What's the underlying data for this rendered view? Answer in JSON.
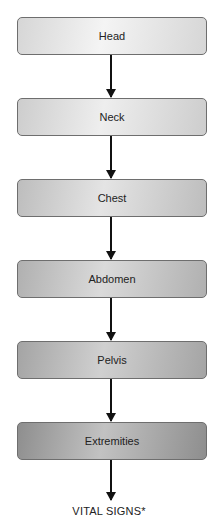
{
  "diagram": {
    "type": "vertical-flowchart",
    "nodes": [
      {
        "label": "Head",
        "gradient": [
          "#f4f4f4",
          "#d6d6d6"
        ]
      },
      {
        "label": "Neck",
        "gradient": [
          "#eeeeee",
          "#cdcdcd"
        ]
      },
      {
        "label": "Chest",
        "gradient": [
          "#e4e4e4",
          "#bdbdbd"
        ]
      },
      {
        "label": "Abdomen",
        "gradient": [
          "#dadada",
          "#b0b0b0"
        ]
      },
      {
        "label": "Pelvis",
        "gradient": [
          "#d0d0d0",
          "#a4a4a4"
        ]
      },
      {
        "label": "Extremities",
        "gradient": [
          "#c2c2c2",
          "#8e8e8e"
        ]
      }
    ],
    "end_label": "VITAL SIGNS*",
    "colors": {
      "border": "#6e6e6e",
      "arrow": "#111111",
      "text": "#222222",
      "background": "#ffffff"
    }
  }
}
